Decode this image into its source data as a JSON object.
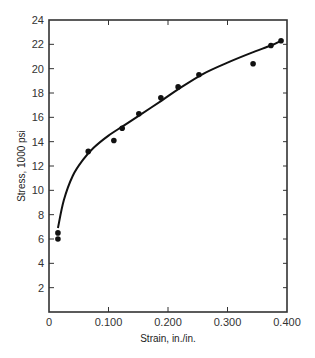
{
  "chart_data": {
    "type": "scatter",
    "title": "",
    "xlabel": "Strain, in./in.",
    "ylabel": "Stress, 1000 psi",
    "xlim": [
      0,
      0.4
    ],
    "ylim": [
      0,
      24
    ],
    "grid": false,
    "legend": null,
    "x_ticks": [
      0,
      0.1,
      0.2,
      0.3,
      0.4
    ],
    "x_tick_labels": [
      "0",
      "0.100",
      "0.200",
      "0.300",
      "0.400"
    ],
    "y_ticks": [
      2,
      4,
      6,
      8,
      10,
      12,
      14,
      16,
      18,
      20,
      22,
      24
    ],
    "y_tick_labels": [
      "2",
      "4",
      "6",
      "8",
      "10",
      "12",
      "14",
      "16",
      "18",
      "20",
      "22",
      "24"
    ],
    "series": [
      {
        "name": "Measured data",
        "style": "markers",
        "x": [
          0.015,
          0.015,
          0.066,
          0.109,
          0.123,
          0.151,
          0.188,
          0.217,
          0.252,
          0.343,
          0.373,
          0.39
        ],
        "y": [
          6.5,
          6.0,
          13.2,
          14.1,
          15.1,
          16.3,
          17.6,
          18.5,
          19.5,
          20.4,
          21.9,
          22.3
        ]
      },
      {
        "name": "Fitted curve",
        "style": "line",
        "x": [
          0.015,
          0.025,
          0.04,
          0.057,
          0.075,
          0.1,
          0.125,
          0.15,
          0.19,
          0.22,
          0.26,
          0.3,
          0.34,
          0.373,
          0.39
        ],
        "y": [
          6.9,
          9.2,
          11.2,
          12.5,
          13.5,
          14.5,
          15.3,
          16.1,
          17.4,
          18.4,
          19.6,
          20.5,
          21.3,
          21.9,
          22.3
        ]
      }
    ],
    "colors": {
      "line": "#111111",
      "markers": "#111111",
      "axes": "#333333"
    }
  }
}
